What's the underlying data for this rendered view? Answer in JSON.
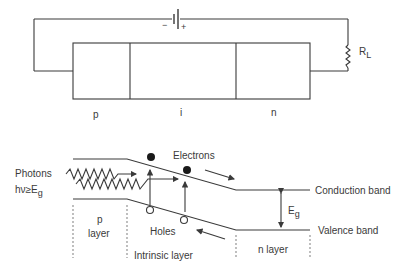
{
  "circuit": {
    "battery": {
      "minus_label": "−",
      "plus_label": "+"
    },
    "resistor_label": "R",
    "resistor_subscript": "L",
    "regions": [
      {
        "id": "p",
        "label": "p"
      },
      {
        "id": "i",
        "label": "i"
      },
      {
        "id": "n",
        "label": "n"
      }
    ]
  },
  "band_diagram": {
    "photons_label": "Photons",
    "photon_condition": "hν≥E",
    "photon_condition_subscript": "g",
    "electrons_label": "Electrons",
    "holes_label": "Holes",
    "conduction_band_label": "Conduction band",
    "valence_band_label": "Valence band",
    "gap_label": "E",
    "gap_subscript": "g",
    "p_layer_label_line1": "p",
    "p_layer_label_line2": "layer",
    "intrinsic_layer_label": "Intrinsic layer",
    "n_layer_label": "n layer"
  },
  "colors": {
    "line": "#3a3a3a",
    "dotted": "#8a8a8a",
    "background": "#ffffff"
  }
}
